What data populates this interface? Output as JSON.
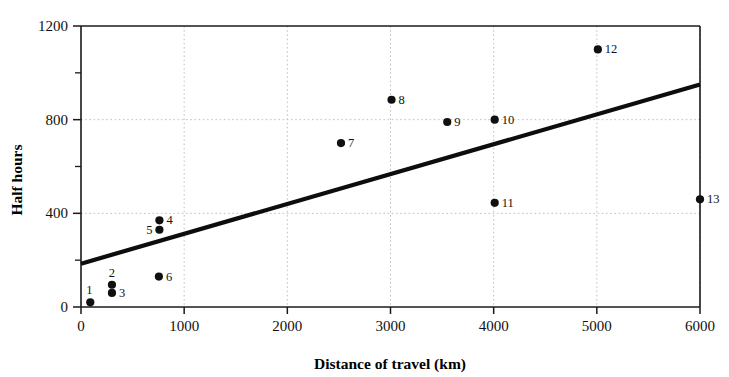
{
  "chart_data": {
    "type": "scatter",
    "title": "",
    "xlabel": "Distance of travel (km)",
    "ylabel": "Half hours",
    "xlim": [
      0,
      6000
    ],
    "ylim": [
      0,
      1200
    ],
    "xticks": [
      0,
      1000,
      2000,
      3000,
      4000,
      5000,
      6000
    ],
    "yticks": [
      0,
      400,
      800,
      1200
    ],
    "y_minor_ticks": [
      200,
      600,
      1000
    ],
    "xtick_labels": [
      "0",
      "1000",
      "2000",
      "3000",
      "4000",
      "5000",
      "6000"
    ],
    "ytick_labels": [
      "0",
      "400",
      "800",
      "1200"
    ],
    "grid": true,
    "grid_style": "dotted",
    "legend": "none",
    "point_color": "#101010",
    "line_color": "#0d0d0d",
    "grid_color": "#b9b9b9",
    "axis_color": "#1a1a1a",
    "points": [
      {
        "label": "1",
        "x": 90,
        "y": 20,
        "label_pos": "above-left"
      },
      {
        "label": "2",
        "x": 300,
        "y": 95,
        "label_pos": "above"
      },
      {
        "label": "3",
        "x": 300,
        "y": 60,
        "label_pos": "right"
      },
      {
        "label": "4",
        "x": 760,
        "y": 370,
        "label_pos": "right"
      },
      {
        "label": "5",
        "x": 760,
        "y": 330,
        "label_pos": "left"
      },
      {
        "label": "6",
        "x": 755,
        "y": 130,
        "label_pos": "right"
      },
      {
        "label": "7",
        "x": 2520,
        "y": 700,
        "label_pos": "right"
      },
      {
        "label": "8",
        "x": 3010,
        "y": 885,
        "label_pos": "right"
      },
      {
        "label": "9",
        "x": 3550,
        "y": 790,
        "label_pos": "right"
      },
      {
        "label": "10",
        "x": 4010,
        "y": 800,
        "label_pos": "right"
      },
      {
        "label": "11",
        "x": 4010,
        "y": 445,
        "label_pos": "right"
      },
      {
        "label": "12",
        "x": 5010,
        "y": 1100,
        "label_pos": "right"
      },
      {
        "label": "13",
        "x": 6000,
        "y": 460,
        "label_pos": "right"
      }
    ],
    "trendline": {
      "type": "linear-fit",
      "x_start": 0,
      "y_start": 185,
      "x_end": 6000,
      "y_end": 950
    }
  }
}
